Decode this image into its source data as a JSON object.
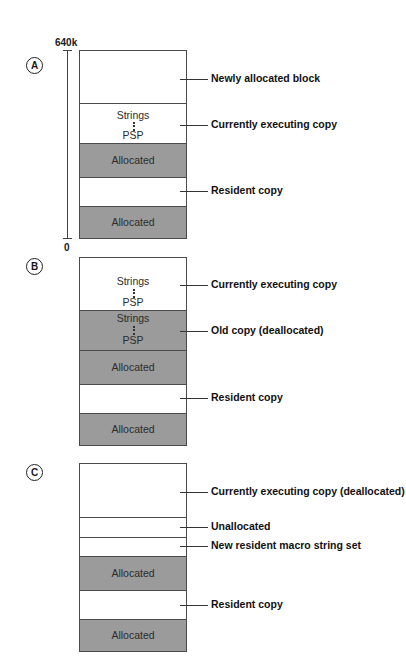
{
  "diagrams": {
    "a": {
      "marker": "A",
      "ruler": {
        "top_label": "640k",
        "bottom_label": "0"
      },
      "blocks": [
        {
          "fill": "white",
          "text": ""
        },
        {
          "fill": "white",
          "text_top": "Strings",
          "text_bottom": "PSP"
        },
        {
          "fill": "gray",
          "text": "Allocated"
        },
        {
          "fill": "white",
          "text": ""
        },
        {
          "fill": "gray",
          "text": "Allocated"
        }
      ],
      "labels": [
        "Newly allocated block",
        "Currently executing copy",
        "Resident copy"
      ]
    },
    "b": {
      "marker": "B",
      "blocks": [
        {
          "fill": "white",
          "text_top": "Strings",
          "text_bottom": "PSP"
        },
        {
          "fill": "gray",
          "text_top": "Strings",
          "text_bottom": "PSP"
        },
        {
          "fill": "gray",
          "text": "Allocated"
        },
        {
          "fill": "white",
          "text": ""
        },
        {
          "fill": "gray",
          "text": "Allocated"
        }
      ],
      "labels": [
        "Currently executing copy",
        "Old copy (deallocated)",
        "Resident copy"
      ]
    },
    "c": {
      "marker": "C",
      "blocks": [
        {
          "fill": "white",
          "text": ""
        },
        {
          "fill": "white",
          "text": ""
        },
        {
          "fill": "white",
          "text": ""
        },
        {
          "fill": "gray",
          "text": "Allocated"
        },
        {
          "fill": "white",
          "text": ""
        },
        {
          "fill": "gray",
          "text": "Allocated"
        }
      ],
      "labels": [
        "Currently executing copy (deallocated)",
        "Unallocated",
        "New resident macro string set",
        "Resident copy"
      ]
    }
  },
  "colors": {
    "allocated_fill": "#9b9b9b",
    "free_fill": "#ffffff",
    "border": "#4a4a4a"
  }
}
